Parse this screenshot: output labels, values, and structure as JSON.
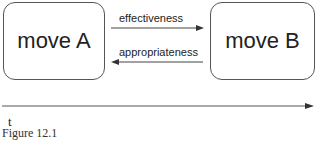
{
  "diagram": {
    "nodes": [
      {
        "id": "A",
        "label": "move A"
      },
      {
        "id": "B",
        "label": "move B"
      }
    ],
    "edges": [
      {
        "from": "A",
        "to": "B",
        "label": "effectiveness"
      },
      {
        "from": "B",
        "to": "A",
        "label": "appropriateness"
      }
    ],
    "timeline": {
      "label": "t"
    },
    "caption": "Figure 12.1"
  }
}
